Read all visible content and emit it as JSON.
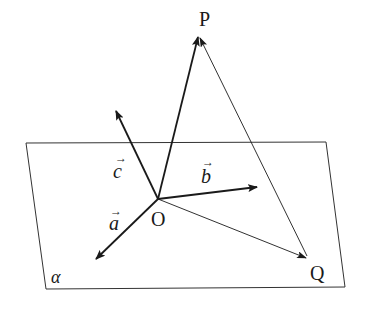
{
  "diagram": {
    "plane": {
      "label": "α",
      "corners": [
        [
          26,
          143
        ],
        [
          326,
          142
        ],
        [
          345,
          287
        ],
        [
          46,
          289
        ]
      ]
    },
    "origin": {
      "label": "O",
      "x": 158,
      "y": 199
    },
    "points": {
      "P": {
        "label": "P",
        "x": 199,
        "y": 36
      },
      "Q": {
        "label": "Q",
        "x": 307,
        "y": 258
      }
    },
    "vectors": [
      {
        "name": "a",
        "label": "a",
        "arrow": "→",
        "tip": [
          95,
          260
        ]
      },
      {
        "name": "b",
        "label": "b",
        "arrow": "→",
        "tip": [
          258,
          187
        ]
      },
      {
        "name": "c",
        "label": "c",
        "arrow": "→",
        "tip": [
          115,
          110
        ]
      }
    ],
    "segments": [
      {
        "from": "O",
        "to": "P",
        "style": "thick-arrow"
      },
      {
        "from": "O",
        "to": "Q",
        "style": "thin-arrow"
      },
      {
        "from": "Q",
        "to": "P",
        "style": "thin-arrow"
      }
    ],
    "colors": {
      "line": "#1a1a1a",
      "background": "#ffffff"
    }
  }
}
